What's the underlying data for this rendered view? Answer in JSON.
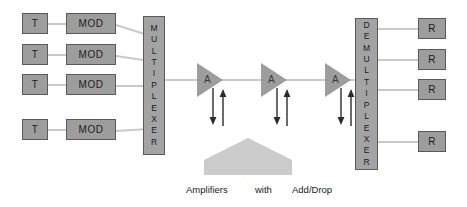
{
  "diagram": {
    "background_color": "#ffffff",
    "node_fill": "#9d9d9d",
    "node_border": "#5a5a5a",
    "link_color": "#c9c9c9",
    "house_color": "#cbcbcb",
    "arrow_color": "#2b2b2b"
  },
  "transmitters": [
    {
      "label": "T"
    },
    {
      "label": "T"
    },
    {
      "label": "T"
    },
    {
      "label": "T"
    }
  ],
  "modulators": [
    {
      "label": "MOD"
    },
    {
      "label": "MOD"
    },
    {
      "label": "MOD"
    },
    {
      "label": "MOD"
    }
  ],
  "multiplexer": {
    "label": "MULTIPLEXER",
    "letters": [
      "M",
      "U",
      "L",
      "T",
      "I",
      "P",
      "L",
      "E",
      "X",
      "E",
      "R"
    ]
  },
  "amplifiers": [
    {
      "label": "A"
    },
    {
      "label": "A"
    },
    {
      "label": "A"
    }
  ],
  "demultiplexer": {
    "label": "DEMULTIPLEXER",
    "letters": [
      "D",
      "E",
      "M",
      "U",
      "L",
      "T",
      "I",
      "P",
      "L",
      "E",
      "X",
      "E",
      "R"
    ]
  },
  "receivers": [
    {
      "label": "R"
    },
    {
      "label": "R"
    },
    {
      "label": "R"
    },
    {
      "label": "R"
    }
  ],
  "caption": {
    "part1": "Amplifiers",
    "part2": "with",
    "part3": "Add/Drop"
  }
}
